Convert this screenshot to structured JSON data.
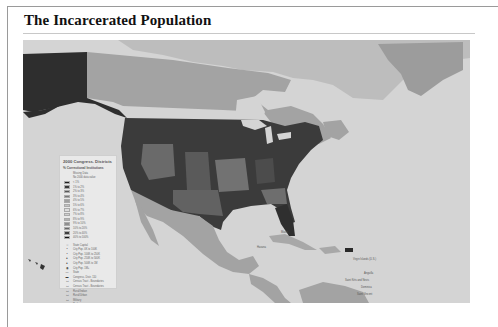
{
  "page": {
    "title": "The Incarcerated Population"
  },
  "map": {
    "subject": "2000 Congressional Districts — % Correctional Institutions",
    "colors": {
      "ocean": "#d6d6d6",
      "land_other": "#a3a3a3",
      "canada_light": "#b7b7b7",
      "high": "#2b2b2b",
      "mid": "#585858",
      "low": "#7c7c7c"
    },
    "labels": {
      "florida_city": "Miami",
      "cuba_city": "Havana",
      "caribbean_1": "Virgin Islands (U.S.)",
      "caribbean_2": "Anguilla",
      "caribbean_3": "Saint Kitts and Nevis",
      "caribbean_4": "Dominica",
      "caribbean_5": "Saint Vincent",
      "greenland": "Greenland"
    }
  },
  "legend": {
    "title": "2000 Congress. Districts",
    "subtitle": "% Correctional Institutions",
    "group_header": "Missing Data",
    "group_note": "No 2000 data value",
    "classes": [
      {
        "label": "< 1%",
        "color": "#1e1e1e"
      },
      {
        "label": "1% to 2%",
        "color": "#3a3a3a"
      },
      {
        "label": "2% to 3%",
        "color": "#585858"
      },
      {
        "label": "3% to 4%",
        "color": "#7a7a7a"
      },
      {
        "label": "4% to 5%",
        "color": "#a0a0a0"
      },
      {
        "label": "5% to 6%",
        "color": "#c2c2c2"
      },
      {
        "label": "6% to 7%",
        "color": "#dcdcdc"
      },
      {
        "label": "7% to 8%",
        "color": "#cfcfcf"
      },
      {
        "label": "8% to 9%",
        "color": "#b4b4b4"
      },
      {
        "label": "9% to 10%",
        "color": "#8e8e8e"
      },
      {
        "label": "10% to 20%",
        "color": "#666666"
      },
      {
        "label": "20% to 40%",
        "color": "#3e3e3e"
      },
      {
        "label": "40% to 100%",
        "color": "#111111"
      }
    ],
    "symbols": [
      {
        "glyph": "☆",
        "label": "State Capital"
      },
      {
        "glyph": "•",
        "label": "City Pop. 0K to 100K"
      },
      {
        "glyph": "•",
        "label": "City Pop. 100K to 250K"
      },
      {
        "glyph": "●",
        "label": "City Pop. 250K to 500K"
      },
      {
        "glyph": "●",
        "label": "City Pop. 500K to 1M"
      },
      {
        "glyph": "◉",
        "label": "City Pop. 1M+"
      },
      {
        "glyph": "—",
        "label": "State"
      },
      {
        "glyph": "▬",
        "label": "Congress. Distr. 110"
      },
      {
        "glyph": "▭",
        "label": "Census Tract - Boundaries"
      },
      {
        "glyph": "▭",
        "label": "Census Tract - Boundaries"
      },
      {
        "glyph": "▭",
        "label": "Rural/Indian"
      },
      {
        "glyph": "▭",
        "label": "Rural/Urban"
      },
      {
        "glyph": "▭",
        "label": "Military"
      },
      {
        "glyph": "",
        "label": "Parks"
      }
    ]
  }
}
